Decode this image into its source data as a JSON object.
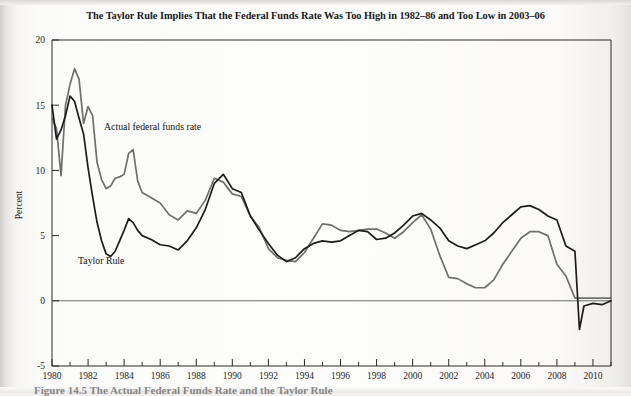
{
  "title": "The Taylor Rule Implies That the Federal Funds Rate Was Too High in 1982–86 and Too Low in 2003–06",
  "caption": "Figure 14.5 The Actual Federal Funds Rate and the Taylor Rule",
  "annotations": {
    "actual_label": "Actual federal funds rate",
    "taylor_label": "Taylor Rule"
  },
  "colors": {
    "actual": "#6f6f70",
    "taylor": "#1c1c1c",
    "axis": "#2a2a2a",
    "zero_line": "#6d6d6d",
    "page": "#fbfbfa"
  },
  "chart_data": {
    "type": "line",
    "title": "The Taylor Rule Implies That the Federal Funds Rate Was Too High in 1982–86 and Too Low in 2003–06",
    "xlabel": "",
    "ylabel": "Percent",
    "xlim": [
      1980,
      2011
    ],
    "ylim": [
      -5,
      20
    ],
    "yticks": [
      -5,
      0,
      5,
      10,
      15,
      20
    ],
    "xticks": [
      1980,
      1982,
      1984,
      1986,
      1988,
      1990,
      1992,
      1994,
      1996,
      1998,
      2000,
      2002,
      2004,
      2006,
      2008,
      2010
    ],
    "x_minor_tick_step": 1,
    "grid": false,
    "legend": "inline-annotations",
    "series": [
      {
        "name": "Actual federal funds rate",
        "color": "#6f6f70",
        "x": [
          1980.0,
          1980.25,
          1980.5,
          1980.75,
          1981.0,
          1981.25,
          1981.5,
          1981.75,
          1982.0,
          1982.25,
          1982.5,
          1982.75,
          1983.0,
          1983.25,
          1983.5,
          1983.75,
          1984.0,
          1984.25,
          1984.5,
          1984.75,
          1985.0,
          1985.5,
          1986.0,
          1986.5,
          1987.0,
          1987.5,
          1988.0,
          1988.5,
          1989.0,
          1989.5,
          1990.0,
          1990.5,
          1991.0,
          1991.5,
          1992.0,
          1992.5,
          1993.0,
          1993.5,
          1994.0,
          1994.5,
          1995.0,
          1995.5,
          1996.0,
          1996.5,
          1997.0,
          1997.5,
          1998.0,
          1998.5,
          1999.0,
          1999.5,
          2000.0,
          2000.5,
          2001.0,
          2001.5,
          2002.0,
          2002.5,
          2003.0,
          2003.5,
          2004.0,
          2004.5,
          2005.0,
          2005.5,
          2006.0,
          2006.5,
          2007.0,
          2007.5,
          2008.0,
          2008.5,
          2009.0,
          2009.5,
          2010.0,
          2010.5,
          2011.0
        ],
        "y": [
          14.0,
          13.2,
          9.6,
          15.0,
          16.6,
          17.8,
          17.0,
          13.6,
          14.9,
          14.2,
          10.6,
          9.3,
          8.6,
          8.8,
          9.4,
          9.5,
          9.7,
          11.3,
          11.6,
          9.2,
          8.3,
          7.9,
          7.5,
          6.6,
          6.2,
          6.9,
          6.7,
          7.7,
          9.4,
          9.1,
          8.2,
          8.0,
          6.5,
          5.6,
          4.0,
          3.3,
          3.1,
          3.0,
          3.7,
          4.8,
          5.9,
          5.8,
          5.4,
          5.3,
          5.4,
          5.5,
          5.5,
          5.2,
          4.8,
          5.3,
          6.0,
          6.6,
          5.5,
          3.5,
          1.8,
          1.7,
          1.3,
          1.0,
          1.0,
          1.6,
          2.8,
          3.8,
          4.8,
          5.3,
          5.3,
          5.0,
          2.8,
          1.9,
          0.2,
          0.2,
          0.2,
          0.2,
          0.2
        ]
      },
      {
        "name": "Taylor Rule",
        "color": "#1c1c1c",
        "x": [
          1980.0,
          1980.25,
          1980.5,
          1980.75,
          1981.0,
          1981.25,
          1981.5,
          1981.75,
          1982.0,
          1982.25,
          1982.5,
          1982.75,
          1983.0,
          1983.25,
          1983.5,
          1983.75,
          1984.0,
          1984.25,
          1984.5,
          1984.75,
          1985.0,
          1985.5,
          1986.0,
          1986.5,
          1987.0,
          1987.5,
          1988.0,
          1988.5,
          1989.0,
          1989.5,
          1990.0,
          1990.5,
          1991.0,
          1991.5,
          1992.0,
          1992.5,
          1993.0,
          1993.5,
          1994.0,
          1994.5,
          1995.0,
          1995.5,
          1996.0,
          1996.5,
          1997.0,
          1997.5,
          1998.0,
          1998.5,
          1999.0,
          1999.5,
          2000.0,
          2000.5,
          2001.0,
          2001.5,
          2002.0,
          2002.5,
          2003.0,
          2003.5,
          2004.0,
          2004.5,
          2005.0,
          2005.5,
          2006.0,
          2006.5,
          2007.0,
          2007.5,
          2008.0,
          2008.5,
          2009.0,
          2009.25,
          2009.5,
          2010.0,
          2010.5,
          2011.0
        ],
        "y": [
          15.0,
          12.4,
          13.1,
          14.2,
          15.7,
          15.3,
          14.0,
          12.8,
          10.2,
          8.0,
          6.0,
          4.6,
          3.6,
          3.4,
          3.8,
          4.6,
          5.4,
          6.3,
          6.0,
          5.4,
          5.0,
          4.7,
          4.3,
          4.2,
          3.9,
          4.6,
          5.6,
          7.0,
          9.0,
          9.7,
          8.6,
          8.3,
          6.5,
          5.4,
          4.4,
          3.5,
          3.0,
          3.3,
          4.0,
          4.4,
          4.6,
          4.5,
          4.6,
          5.0,
          5.4,
          5.3,
          4.7,
          4.8,
          5.2,
          5.8,
          6.5,
          6.7,
          6.2,
          5.6,
          4.6,
          4.2,
          4.0,
          4.3,
          4.6,
          5.2,
          6.0,
          6.6,
          7.2,
          7.3,
          7.0,
          6.5,
          6.2,
          4.2,
          3.8,
          -2.2,
          -0.4,
          -0.2,
          -0.3,
          0.0
        ]
      }
    ]
  }
}
